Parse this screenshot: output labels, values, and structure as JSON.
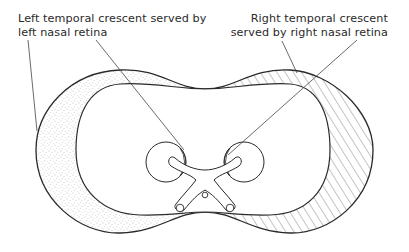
{
  "diagram": {
    "type": "visual-field-map",
    "labels": {
      "left": {
        "line1": "Left temporal crescent served by",
        "line2": "left nasal retina"
      },
      "right": {
        "line1": "Right temporal crescent",
        "line2": "served by right nasal retina"
      }
    },
    "regions": [
      {
        "name": "left-temporal-crescent",
        "fill": "stippled"
      },
      {
        "name": "binocular-field",
        "fill": "none"
      },
      {
        "name": "right-temporal-crescent",
        "fill": "hatched"
      }
    ],
    "colors": {
      "stroke": "#2a2a2a",
      "stipple": "#8a8a8a",
      "hatch": "#555555",
      "background": "#ffffff"
    }
  }
}
